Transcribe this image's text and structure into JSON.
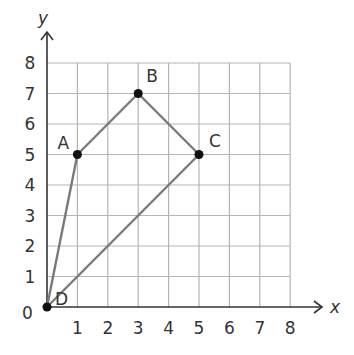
{
  "diagram": {
    "type": "coordinate-plane-polygon",
    "axes": {
      "x_label": "x",
      "y_label": "y",
      "origin_label": "0",
      "x_ticks": [
        "1",
        "2",
        "3",
        "4",
        "5",
        "6",
        "7",
        "8"
      ],
      "y_ticks": [
        "1",
        "2",
        "3",
        "4",
        "5",
        "6",
        "7",
        "8"
      ],
      "range": [
        0,
        8
      ]
    },
    "points": [
      {
        "label": "A",
        "x": 1,
        "y": 5
      },
      {
        "label": "B",
        "x": 3,
        "y": 7
      },
      {
        "label": "C",
        "x": 5,
        "y": 5
      },
      {
        "label": "D",
        "x": 0,
        "y": 0
      }
    ],
    "segments": [
      [
        "D",
        "A"
      ],
      [
        "A",
        "B"
      ],
      [
        "B",
        "C"
      ],
      [
        "C",
        "D"
      ]
    ],
    "colors": {
      "grid": "#b5b5b5",
      "axis": "#333333",
      "segment": "#7a7a7a",
      "point": "#111111",
      "text": "#333333"
    }
  }
}
